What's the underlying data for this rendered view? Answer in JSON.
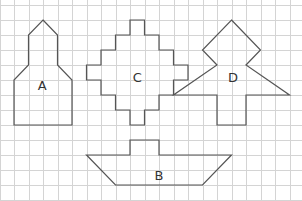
{
  "diagram": {
    "type": "grid-shapes",
    "grid": {
      "unit_x_px": 14.5,
      "unit_y_px": 15,
      "origin_x_px": -0.5,
      "origin_y_px": 5,
      "cols": 21,
      "rows": 14,
      "color": "#d4d4d4"
    },
    "stroke_color": "#555555",
    "shapes": [
      {
        "label": "A",
        "label_pos": [
          2.95,
          5.3
        ],
        "points": [
          [
            3,
            1
          ],
          [
            4,
            2
          ],
          [
            4,
            4
          ],
          [
            5,
            5
          ],
          [
            5,
            8
          ],
          [
            1,
            8
          ],
          [
            1,
            5
          ],
          [
            2,
            4
          ],
          [
            2,
            2
          ]
        ]
      },
      {
        "label": "C",
        "label_pos": [
          9.5,
          4.8
        ],
        "points": [
          [
            9,
            1
          ],
          [
            10,
            1
          ],
          [
            10,
            2
          ],
          [
            11,
            2
          ],
          [
            11,
            3
          ],
          [
            12,
            3
          ],
          [
            12,
            4
          ],
          [
            13,
            4
          ],
          [
            13,
            5
          ],
          [
            12,
            5
          ],
          [
            12,
            6
          ],
          [
            11,
            6
          ],
          [
            11,
            7
          ],
          [
            10,
            7
          ],
          [
            10,
            8
          ],
          [
            9,
            8
          ],
          [
            9,
            7
          ],
          [
            8,
            7
          ],
          [
            8,
            6
          ],
          [
            7,
            6
          ],
          [
            7,
            5
          ],
          [
            6,
            5
          ],
          [
            6,
            4
          ],
          [
            7,
            4
          ],
          [
            7,
            3
          ],
          [
            8,
            3
          ],
          [
            8,
            2
          ],
          [
            9,
            2
          ]
        ]
      },
      {
        "label": "D",
        "label_pos": [
          16.1,
          4.8
        ],
        "points": [
          [
            16,
            1
          ],
          [
            18,
            3
          ],
          [
            17,
            4
          ],
          [
            20,
            6
          ],
          [
            17,
            6
          ],
          [
            17,
            8
          ],
          [
            15,
            8
          ],
          [
            15,
            6
          ],
          [
            12,
            6
          ],
          [
            15,
            4
          ],
          [
            14,
            3
          ]
        ]
      },
      {
        "label": "B",
        "label_pos": [
          11,
          11.3
        ],
        "points": [
          [
            6,
            10
          ],
          [
            9,
            10
          ],
          [
            9,
            9
          ],
          [
            11,
            9
          ],
          [
            11,
            10
          ],
          [
            16,
            10
          ],
          [
            14,
            12
          ],
          [
            8,
            12
          ]
        ]
      }
    ]
  }
}
